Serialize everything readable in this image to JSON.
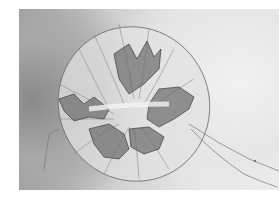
{
  "image": {
    "subject": "jellyfish",
    "description": "Black-and-white photograph of a jellyfish viewed from below, showing scalloped bell margin, dark folded oral arms, and trailing thin tentacles toward the lower right",
    "colors": {
      "background_light": "#efefef",
      "background_dark": "#8a8a8a",
      "bell": "#e4e4e4",
      "oral_arms": "#5a5a5a",
      "outline": "#6e6e6e"
    }
  }
}
